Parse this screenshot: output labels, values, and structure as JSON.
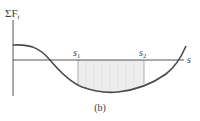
{
  "diagram": {
    "y_axis_label_sigma": "ΣF",
    "y_axis_label_sub": "t",
    "x_axis_label": "s",
    "marker_1": {
      "main": "s",
      "sub": "1"
    },
    "marker_2": {
      "main": "s",
      "sub": "2"
    },
    "caption": "(b)",
    "colors": {
      "axis": "#555555",
      "curve": "#4a4a4a",
      "shade": "#ececec",
      "shade_lines": "#d4d4d4",
      "text": "#3a3a3a"
    }
  }
}
